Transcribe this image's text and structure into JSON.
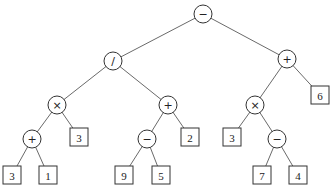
{
  "diagram": {
    "type": "expression-tree",
    "nodes": [
      {
        "id": "n0",
        "kind": "op",
        "label": "−",
        "x": 203,
        "y": 14
      },
      {
        "id": "n1",
        "kind": "op",
        "label": "/",
        "x": 113,
        "y": 61
      },
      {
        "id": "n2",
        "kind": "op",
        "label": "+",
        "x": 287,
        "y": 59
      },
      {
        "id": "n3",
        "kind": "op",
        "label": "×",
        "x": 57,
        "y": 105
      },
      {
        "id": "n4",
        "kind": "op",
        "label": "+",
        "x": 168,
        "y": 105
      },
      {
        "id": "n5",
        "kind": "op",
        "label": "×",
        "x": 255,
        "y": 105
      },
      {
        "id": "n6",
        "kind": "leaf",
        "label": "6",
        "x": 320,
        "y": 95
      },
      {
        "id": "n7",
        "kind": "op",
        "label": "+",
        "x": 32,
        "y": 139
      },
      {
        "id": "n8",
        "kind": "leaf",
        "label": "3",
        "x": 79,
        "y": 137
      },
      {
        "id": "n9",
        "kind": "op",
        "label": "−",
        "x": 147,
        "y": 139
      },
      {
        "id": "n10",
        "kind": "leaf",
        "label": "2",
        "x": 190,
        "y": 137
      },
      {
        "id": "n11",
        "kind": "leaf",
        "label": "3",
        "x": 232,
        "y": 137
      },
      {
        "id": "n12",
        "kind": "op",
        "label": "−",
        "x": 277,
        "y": 139
      },
      {
        "id": "n13",
        "kind": "leaf",
        "label": "3",
        "x": 12,
        "y": 175
      },
      {
        "id": "n14",
        "kind": "leaf",
        "label": "1",
        "x": 48,
        "y": 175
      },
      {
        "id": "n15",
        "kind": "leaf",
        "label": "9",
        "x": 124,
        "y": 175
      },
      {
        "id": "n16",
        "kind": "leaf",
        "label": "5",
        "x": 161,
        "y": 175
      },
      {
        "id": "n17",
        "kind": "leaf",
        "label": "7",
        "x": 262,
        "y": 175
      },
      {
        "id": "n18",
        "kind": "leaf",
        "label": "4",
        "x": 298,
        "y": 175
      }
    ],
    "edges": [
      [
        "n0",
        "n1"
      ],
      [
        "n0",
        "n2"
      ],
      [
        "n1",
        "n3"
      ],
      [
        "n1",
        "n4"
      ],
      [
        "n2",
        "n5"
      ],
      [
        "n2",
        "n6"
      ],
      [
        "n3",
        "n7"
      ],
      [
        "n3",
        "n8"
      ],
      [
        "n4",
        "n9"
      ],
      [
        "n4",
        "n10"
      ],
      [
        "n5",
        "n11"
      ],
      [
        "n5",
        "n12"
      ],
      [
        "n7",
        "n13"
      ],
      [
        "n7",
        "n14"
      ],
      [
        "n9",
        "n15"
      ],
      [
        "n9",
        "n16"
      ],
      [
        "n12",
        "n17"
      ],
      [
        "n12",
        "n18"
      ]
    ]
  }
}
